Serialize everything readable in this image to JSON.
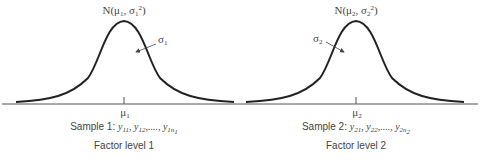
{
  "diagram": {
    "type": "two normal distributions along a common axis",
    "distributions": [
      {
        "label_prefix": "N(μ",
        "label_mean_sub": "1",
        "label_mid": ", σ",
        "label_sigma_sub": "1",
        "label_sup": "2",
        "label_suffix": ")",
        "sigma_label": "σ",
        "sigma_sub": "1",
        "mean_label": "μ",
        "mean_sub": "1",
        "sample_prefix": "Sample 1: ",
        "sample_values": "y",
        "sample_subs": [
          "11",
          "12",
          "1n"
        ],
        "sample_last_sub2": "1",
        "factor_label": "Factor level 1"
      },
      {
        "label_prefix": "N(μ",
        "label_mean_sub": "2",
        "label_mid": ", σ",
        "label_sigma_sub": "2",
        "label_sup": "2",
        "label_suffix": ")",
        "sigma_label": "σ",
        "sigma_sub": "2",
        "mean_label": "μ",
        "mean_sub": "2",
        "sample_prefix": "Sample 2: ",
        "sample_values": "y",
        "sample_subs": [
          "21",
          "22",
          "2n"
        ],
        "sample_last_sub2": "2",
        "factor_label": "Factor level 2"
      }
    ],
    "separator": ", ",
    "ellipsis": ",...., "
  }
}
